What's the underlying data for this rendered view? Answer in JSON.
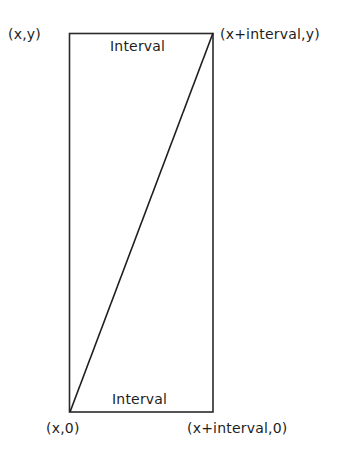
{
  "diagram": {
    "rectangle": {
      "top_left": [
        69,
        33
      ],
      "bottom_right": [
        213,
        412
      ],
      "stroke": "#2a2a2a"
    },
    "diagonal": {
      "from": [
        70,
        412
      ],
      "to": [
        213,
        33
      ],
      "stroke": "#1e1e1e"
    },
    "labels": {
      "top_interval": "Interval",
      "bottom_interval": "Interval",
      "corner_top_left": "(x,y)",
      "corner_top_right": "(x+interval,y)",
      "corner_bottom_left": "(x,0)",
      "corner_bottom_right": "(x+interval,0)"
    }
  }
}
